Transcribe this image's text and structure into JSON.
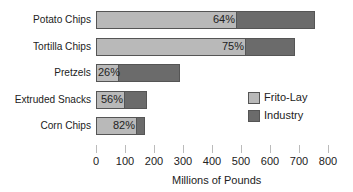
{
  "chart_data": {
    "type": "bar",
    "orientation": "horizontal",
    "stacked": true,
    "title": "",
    "xlabel": "Millions of Pounds",
    "ylabel": "",
    "xlim": [
      0,
      800
    ],
    "x_ticks": [
      "0",
      "100",
      "200",
      "300",
      "400",
      "500",
      "600",
      "700",
      "800"
    ],
    "categories": [
      "Potato Chips",
      "Tortilla Chips",
      "Pretzels",
      "Extruded Snacks",
      "Corn Chips"
    ],
    "series": [
      {
        "name": "Frito-Lay",
        "color": "#b9b9b9",
        "values": [
          483,
          514,
          75,
          98,
          138
        ]
      },
      {
        "name": "Industry",
        "color": "#6b6b6b",
        "values": [
          755,
          685,
          290,
          175,
          168
        ]
      }
    ],
    "frito_lay_share_labels": [
      "64%",
      "75%",
      "26%",
      "56%",
      "82%"
    ],
    "grid": false,
    "legend_position": "right-inside"
  },
  "legend": {
    "items": [
      {
        "label": "Frito-Lay",
        "color": "#b9b9b9"
      },
      {
        "label": "Industry",
        "color": "#6b6b6b"
      }
    ]
  }
}
